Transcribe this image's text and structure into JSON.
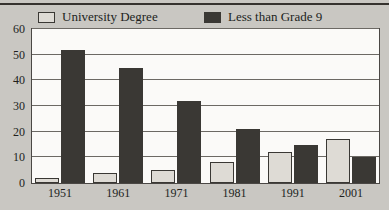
{
  "chart_data": {
    "type": "bar",
    "title": "",
    "xlabel": "",
    "ylabel": "",
    "categories": [
      "1951",
      "1961",
      "1971",
      "1981",
      "1991",
      "2001"
    ],
    "series": [
      {
        "name": "University Degree",
        "color": "#dedbd5",
        "values": [
          2,
          4,
          5,
          8,
          12,
          17
        ]
      },
      {
        "name": "Less than Grade 9",
        "color": "#3a3834",
        "values": [
          52,
          45,
          32,
          21,
          15,
          10
        ]
      }
    ],
    "ylim": [
      0,
      60
    ],
    "y_ticks": [
      0,
      10,
      20,
      30,
      40,
      50,
      60
    ],
    "y_tick_labels": [
      "0",
      "10",
      "20",
      "30",
      "40",
      "50",
      "60"
    ],
    "grid": true,
    "grid_axis": "y",
    "legend_position": "top"
  },
  "legend": {
    "entries": [
      {
        "label": "University Degree",
        "swatch": "light-square-icon"
      },
      {
        "label": "Less than Grade 9",
        "swatch": "dark-square-icon"
      }
    ]
  },
  "colors": {
    "background": "#c9c7c2",
    "plot_background": "#fbfaf8",
    "frame": "#4a4744",
    "gridline": "#6c6964",
    "light_bar": "#dedbd5",
    "dark_bar": "#3a3834",
    "text": "#211f1d"
  }
}
